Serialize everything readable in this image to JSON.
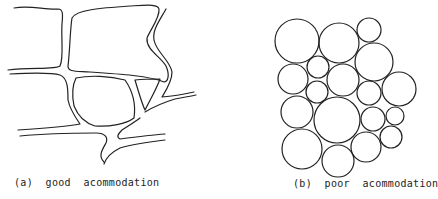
{
  "panels": [
    {
      "id": "a",
      "caption": "(a)  good  acommodation",
      "description": "Irregular, deformable cells tightly fitting together with narrow gaps"
    },
    {
      "id": "b",
      "caption": "(b)  poor  acommodation",
      "description": "Packing of rigid circles of various sizes leaving interstitial gaps",
      "circles": [
        {
          "cx": 297,
          "cy": 41,
          "r": 22
        },
        {
          "cx": 339,
          "cy": 43,
          "r": 20
        },
        {
          "cx": 369,
          "cy": 30,
          "r": 12
        },
        {
          "cx": 374,
          "cy": 62,
          "r": 19
        },
        {
          "cx": 293,
          "cy": 79,
          "r": 15
        },
        {
          "cx": 318,
          "cy": 67,
          "r": 11
        },
        {
          "cx": 343,
          "cy": 80,
          "r": 16
        },
        {
          "cx": 317,
          "cy": 92,
          "r": 11
        },
        {
          "cx": 369,
          "cy": 93,
          "r": 12
        },
        {
          "cx": 399,
          "cy": 89,
          "r": 17
        },
        {
          "cx": 297,
          "cy": 112,
          "r": 16
        },
        {
          "cx": 337,
          "cy": 120,
          "r": 23
        },
        {
          "cx": 373,
          "cy": 119,
          "r": 12
        },
        {
          "cx": 395,
          "cy": 116,
          "r": 9
        },
        {
          "cx": 302,
          "cy": 149,
          "r": 20
        },
        {
          "cx": 338,
          "cy": 161,
          "r": 16
        },
        {
          "cx": 366,
          "cy": 147,
          "r": 15
        },
        {
          "cx": 391,
          "cy": 137,
          "r": 11
        }
      ]
    }
  ],
  "colors": {
    "stroke": "#222222",
    "background": "#ffffff"
  }
}
